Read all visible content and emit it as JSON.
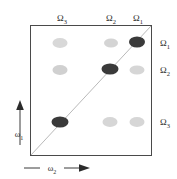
{
  "figure": {
    "type": "2d-correlation-spectrum-schematic",
    "background_color": "#ffffff",
    "frame_color": "#4a4a4a",
    "diagonal_color": "#b3b3b3"
  },
  "axes": {
    "x_axis_label": "ω",
    "x_axis_subscript": "2",
    "y_axis_label": "ω",
    "y_axis_subscript": "1",
    "x_arrow": "arrow-right",
    "y_arrow": "arrow-up"
  },
  "top_labels": [
    {
      "text": "Ω",
      "sub": "3",
      "x": 62,
      "y": 18
    },
    {
      "text": "Ω",
      "sub": "2",
      "x": 111,
      "y": 18
    },
    {
      "text": "Ω",
      "sub": "1",
      "x": 138,
      "y": 18
    }
  ],
  "right_labels": [
    {
      "text": "Ω",
      "sub": "1",
      "x": 165,
      "y": 43
    },
    {
      "text": "Ω",
      "sub": "2",
      "x": 165,
      "y": 70
    },
    {
      "text": "Ω",
      "sub": "3",
      "x": 165,
      "y": 122
    }
  ],
  "chart_data": {
    "type": "scatter",
    "title": "",
    "xlabel": "ω₂",
    "ylabel": "ω₁",
    "grid": false,
    "legend": "none",
    "x_categories": [
      "Ω₃",
      "Ω₂",
      "Ω₁"
    ],
    "y_categories": [
      "Ω₁",
      "Ω₂",
      "Ω₃"
    ],
    "diagonal": {
      "from": [
        30,
        156
      ],
      "to": [
        152,
        25
      ],
      "color": "#b8b8b8",
      "width": 1
    },
    "peaks": [
      {
        "name": "cross-peak-w3-W1",
        "x": 60,
        "y": 43,
        "rx": 7.5,
        "ry": 5.0,
        "intensity": "weak",
        "color": "#d8d8d8"
      },
      {
        "name": "cross-peak-w2-W1",
        "x": 111,
        "y": 43,
        "rx": 7.0,
        "ry": 4.5,
        "intensity": "weak",
        "color": "#d4d4d4"
      },
      {
        "name": "diagonal-peak-W1",
        "x": 137,
        "y": 42,
        "rx": 8.0,
        "ry": 5.5,
        "intensity": "strong",
        "color": "#3a3a3a"
      },
      {
        "name": "cross-peak-w3-W2",
        "x": 60,
        "y": 70,
        "rx": 7.5,
        "ry": 5.0,
        "intensity": "weak",
        "color": "#d0d0d0"
      },
      {
        "name": "diagonal-peak-W2",
        "x": 110,
        "y": 69,
        "rx": 8.5,
        "ry": 5.5,
        "intensity": "strong",
        "color": "#3a3a3a"
      },
      {
        "name": "cross-peak-w1-W2",
        "x": 137,
        "y": 70,
        "rx": 7.5,
        "ry": 4.5,
        "intensity": "weak",
        "color": "#d6d6d6"
      },
      {
        "name": "diagonal-peak-W3",
        "x": 60,
        "y": 122,
        "rx": 8.5,
        "ry": 5.5,
        "intensity": "strong",
        "color": "#3a3a3a"
      },
      {
        "name": "cross-peak-w2-W3",
        "x": 110,
        "y": 122,
        "rx": 7.5,
        "ry": 5.0,
        "intensity": "weak",
        "color": "#d6d6d6"
      },
      {
        "name": "cross-peak-w1-W3",
        "x": 137,
        "y": 122,
        "rx": 7.5,
        "ry": 5.0,
        "intensity": "weak",
        "color": "#d6d6d6"
      }
    ],
    "axis_ranges": {
      "x": [
        30,
        152
      ],
      "y": [
        25,
        156
      ]
    }
  }
}
